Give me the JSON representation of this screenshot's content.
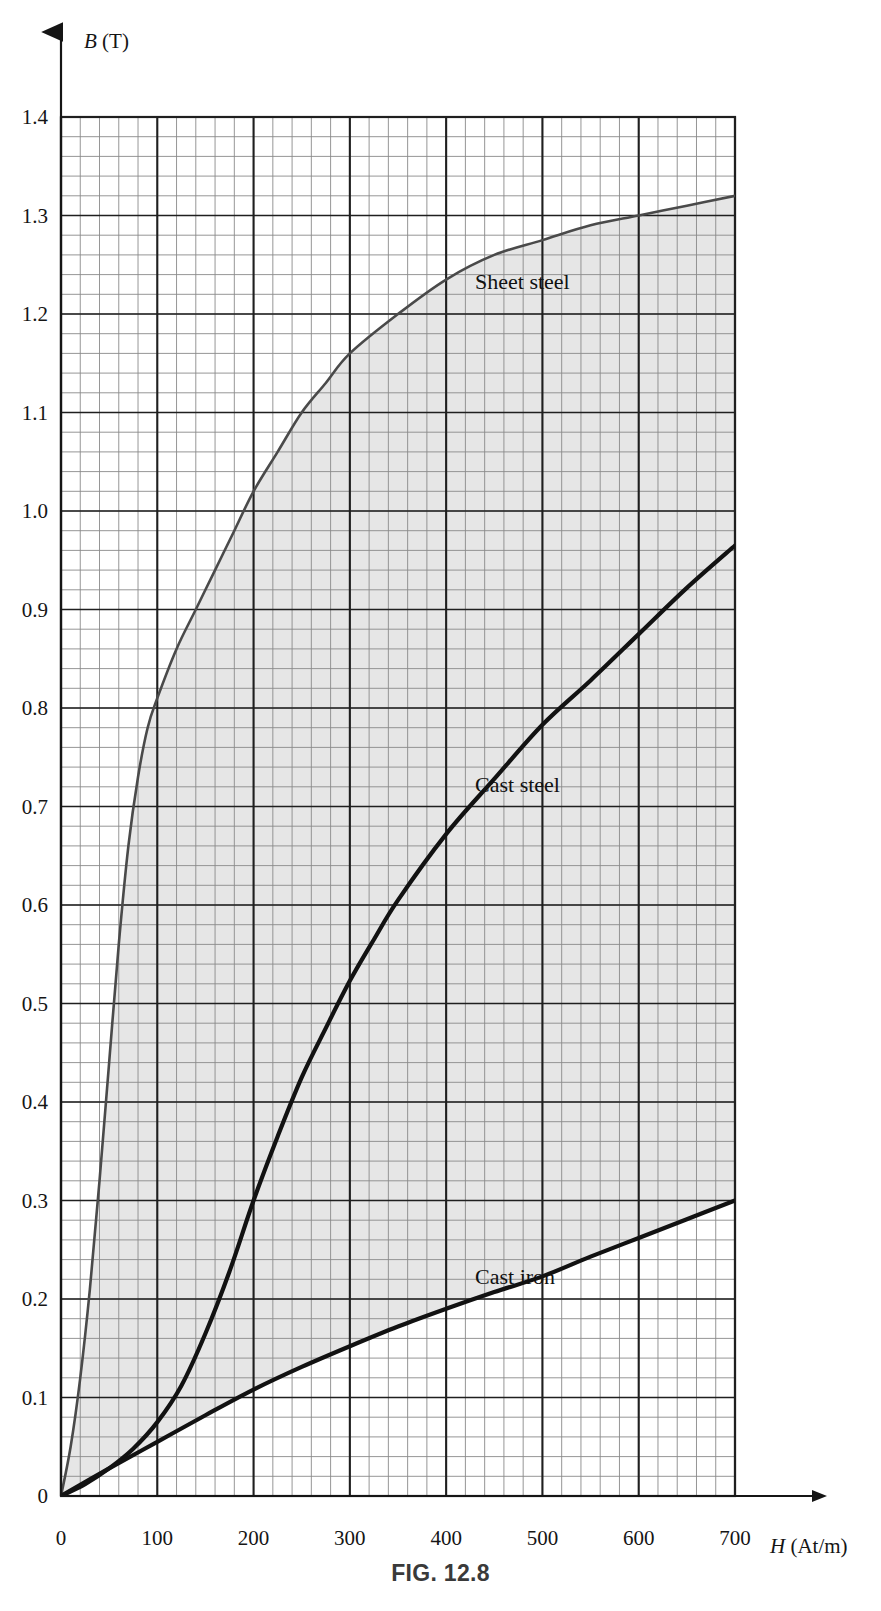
{
  "figure": {
    "caption": "FIG. 12.8"
  },
  "axes": {
    "y_title_var": "B",
    "y_title_unit": " (T)",
    "x_title_var": "H",
    "x_title_unit": " (At/m)",
    "y_tick_labels": [
      "0",
      "0.1",
      "0.2",
      "0.3",
      "0.4",
      "0.5",
      "0.6",
      "0.7",
      "0.8",
      "0.9",
      "1.0",
      "1.1",
      "1.2",
      "1.3",
      "1.4"
    ],
    "x_tick_labels": [
      "0",
      "100",
      "200",
      "300",
      "400",
      "500",
      "600",
      "700"
    ]
  },
  "labels": {
    "sheet_steel": "Sheet steel",
    "cast_steel": "Cast steel",
    "cast_iron": "Cast iron"
  },
  "colors": {
    "grid_minor": "#8a8a8a",
    "grid_major": "#1f1f1f",
    "curve": "#121212",
    "shading": "#e6e6e6",
    "text": "#151515"
  },
  "chart_data": {
    "type": "line",
    "title": "FIG. 12.8",
    "xlabel": "H (At/m)",
    "ylabel": "B (T)",
    "xlim": [
      0,
      700
    ],
    "ylim": [
      0,
      1.4
    ],
    "grid": true,
    "x_major_step": 100,
    "x_minor_step": 20,
    "y_major_step": 0.1,
    "y_minor_step": 0.02,
    "legend": "inline-annotations",
    "shaded_band": {
      "between": [
        "Sheet steel",
        "Cast iron"
      ],
      "color": "#e6e6e6"
    },
    "series": [
      {
        "name": "Sheet steel",
        "x": [
          0,
          10,
          20,
          30,
          40,
          50,
          60,
          70,
          80,
          90,
          100,
          120,
          140,
          160,
          180,
          200,
          225,
          250,
          275,
          300,
          350,
          400,
          450,
          500,
          550,
          600,
          650,
          700
        ],
        "values": [
          0,
          0.05,
          0.12,
          0.21,
          0.32,
          0.44,
          0.56,
          0.66,
          0.73,
          0.78,
          0.81,
          0.86,
          0.9,
          0.94,
          0.98,
          1.02,
          1.06,
          1.1,
          1.13,
          1.16,
          1.2,
          1.235,
          1.26,
          1.275,
          1.29,
          1.3,
          1.31,
          1.32
        ],
        "label_position": {
          "x": 430,
          "y": 1.225
        }
      },
      {
        "name": "Cast steel",
        "x": [
          0,
          25,
          50,
          75,
          100,
          125,
          150,
          175,
          200,
          225,
          250,
          275,
          300,
          325,
          350,
          400,
          450,
          500,
          550,
          600,
          650,
          700
        ],
        "values": [
          0,
          0.012,
          0.028,
          0.048,
          0.075,
          0.112,
          0.165,
          0.228,
          0.3,
          0.365,
          0.425,
          0.475,
          0.523,
          0.565,
          0.605,
          0.672,
          0.728,
          0.783,
          0.828,
          0.875,
          0.922,
          0.965
        ],
        "label_position": {
          "x": 430,
          "y": 0.715
        }
      },
      {
        "name": "Cast iron",
        "x": [
          0,
          50,
          100,
          150,
          200,
          250,
          300,
          350,
          400,
          450,
          500,
          550,
          600,
          650,
          700
        ],
        "values": [
          0,
          0.028,
          0.055,
          0.082,
          0.108,
          0.131,
          0.152,
          0.172,
          0.19,
          0.207,
          0.223,
          0.243,
          0.262,
          0.281,
          0.3
        ],
        "label_position": {
          "x": 430,
          "y": 0.215
        }
      }
    ]
  }
}
